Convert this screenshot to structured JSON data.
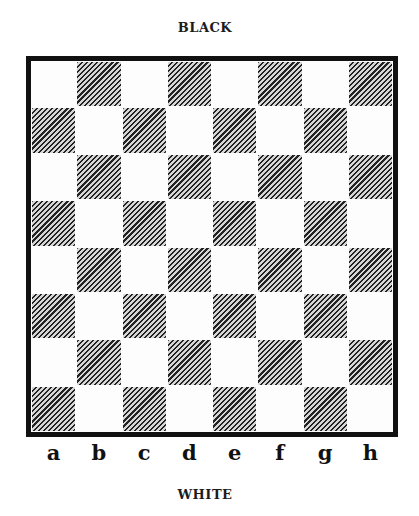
{
  "diagram": {
    "type": "chessboard",
    "top_label": "BLACK",
    "bottom_label": "WHITE",
    "files": [
      "a",
      "b",
      "c",
      "d",
      "e",
      "f",
      "g",
      "h"
    ],
    "ranks": [
      "8",
      "7",
      "6",
      "5",
      "4",
      "3",
      "2",
      "1"
    ],
    "rank_labels_visible": false,
    "square_colors": {
      "light": "#ffffff",
      "dark": "hatched"
    },
    "border_color": "#111111",
    "a1_color": "dark",
    "h8_color": "dark"
  }
}
